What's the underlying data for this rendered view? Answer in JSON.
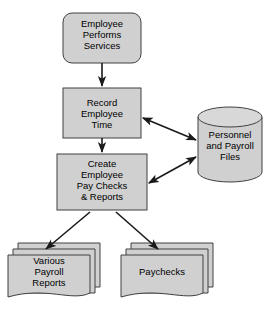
{
  "diagram": {
    "colors": {
      "shape_fill": "#d0d0d0",
      "shape_stroke": "#404040",
      "connector": "#1a1a1a",
      "background": "#ffffff",
      "text": "#000000"
    },
    "nodes": [
      {
        "id": "employee-performs-services",
        "shape": "rounded-rectangle",
        "label": "Employee\nPerforms\nServices"
      },
      {
        "id": "record-employee-time",
        "shape": "rectangle",
        "label": "Record\nEmployee\nTime"
      },
      {
        "id": "create-employee-pay-checks",
        "shape": "rectangle",
        "label": "Create\nEmployee\nPay Checks\n& Reports"
      },
      {
        "id": "personnel-and-payroll-files",
        "shape": "cylinder",
        "label": "Personnel\nand Payroll\nFiles"
      },
      {
        "id": "various-payroll-reports",
        "shape": "document-stack",
        "label": "Various\nPayroll\nReports"
      },
      {
        "id": "paychecks",
        "shape": "document-stack",
        "label": "Paychecks"
      }
    ],
    "connectors": [
      {
        "id": "services-to-record",
        "from": "employee-performs-services",
        "to": "record-employee-time",
        "arrow": "single"
      },
      {
        "id": "record-to-create",
        "from": "record-employee-time",
        "to": "create-employee-pay-checks",
        "arrow": "single"
      },
      {
        "id": "record-to-files",
        "from": "record-employee-time",
        "to": "personnel-and-payroll-files",
        "arrow": "double"
      },
      {
        "id": "create-to-files",
        "from": "create-employee-pay-checks",
        "to": "personnel-and-payroll-files",
        "arrow": "double"
      },
      {
        "id": "create-to-reports",
        "from": "create-employee-pay-checks",
        "to": "various-payroll-reports",
        "arrow": "single"
      },
      {
        "id": "create-to-paychecks",
        "from": "create-employee-pay-checks",
        "to": "paychecks",
        "arrow": "single"
      }
    ]
  }
}
